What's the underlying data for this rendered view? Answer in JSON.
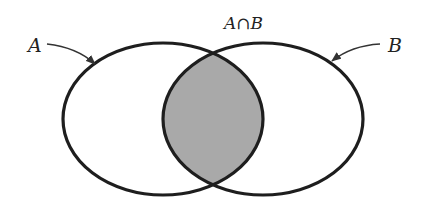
{
  "diagram": {
    "type": "venn",
    "sets": [
      {
        "id": "A",
        "label": "A"
      },
      {
        "id": "B",
        "label": "B"
      }
    ],
    "intersection": {
      "label": "A∩B",
      "shaded": true
    },
    "colors": {
      "outline": "#1e1e1e",
      "intersection_fill": "#a9a9a9",
      "background": "#ffffff",
      "arrow": "#333333"
    }
  }
}
